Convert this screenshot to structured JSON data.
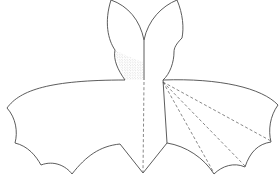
{
  "figure": {
    "colors": {
      "background": "#ffffff",
      "outline": "#4a4a4a",
      "fold_lines": "#555555",
      "stipple": "#888888"
    },
    "parts": [
      {
        "name": "left-ear",
        "style": "solid"
      },
      {
        "name": "right-ear",
        "style": "solid"
      },
      {
        "name": "left-wing",
        "style": "solid"
      },
      {
        "name": "right-wing",
        "style": "solid"
      },
      {
        "name": "stippled-shoulder",
        "style": "dotted"
      },
      {
        "name": "center-fold-line",
        "style": "dashed"
      },
      {
        "name": "right-wing-fold-lines",
        "style": "dashed",
        "count": 4
      }
    ]
  }
}
